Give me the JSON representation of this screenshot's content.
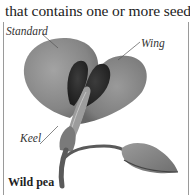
{
  "text": {
    "intro_line": "that contains one or more seeds."
  },
  "illustration": {
    "subject": "wild-pea-flower",
    "labels": {
      "standard": "Standard",
      "wing": "Wing",
      "keel": "Keel"
    },
    "caption": "Wild pea"
  },
  "colors": {
    "background": "#ffffff",
    "text": "#222222",
    "petal_light": "#8e8e8e",
    "petal_dark": "#2b2b2b",
    "stem": "#5a5a5a",
    "frame": "#9a9a9a"
  }
}
